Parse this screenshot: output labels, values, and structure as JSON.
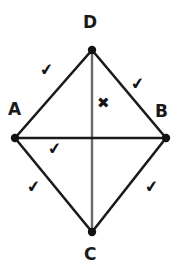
{
  "figure": {
    "background_color": "#ffffff",
    "stroke_color": "#1a1a1a",
    "diagonal_vertical_color": "#6a6a6a",
    "vertices": [
      {
        "id": "D",
        "label": "D",
        "x": 92,
        "y": 50,
        "label_x": 83,
        "label_y": 14
      },
      {
        "id": "A",
        "label": "A",
        "x": 15,
        "y": 138,
        "label_x": 8,
        "label_y": 101
      },
      {
        "id": "B",
        "label": "B",
        "x": 166,
        "y": 138,
        "label_x": 155,
        "label_y": 103
      },
      {
        "id": "C",
        "label": "C",
        "x": 92,
        "y": 232,
        "label_x": 84,
        "label_y": 246
      }
    ],
    "sides": [
      {
        "id": "AD",
        "from": "A",
        "to": "D"
      },
      {
        "id": "DB",
        "from": "D",
        "to": "B"
      },
      {
        "id": "AC",
        "from": "A",
        "to": "C"
      },
      {
        "id": "CB",
        "from": "C",
        "to": "B"
      }
    ],
    "diagonals": [
      {
        "id": "DC",
        "from": "D",
        "to": "C",
        "color": "#6a6a6a"
      },
      {
        "id": "AB",
        "from": "A",
        "to": "B",
        "color": "#1a1a1a"
      }
    ],
    "marks": [
      {
        "id": "check-side-ad",
        "glyph": "✔",
        "kind": "check",
        "x": 40,
        "y": 62,
        "rotate": -8
      },
      {
        "id": "check-side-db",
        "glyph": "✔",
        "kind": "check",
        "x": 131,
        "y": 76,
        "rotate": -8
      },
      {
        "id": "check-angle-a",
        "glyph": "✔",
        "kind": "check",
        "x": 48,
        "y": 141,
        "rotate": -8
      },
      {
        "id": "check-side-ac",
        "glyph": "✔",
        "kind": "check",
        "x": 27,
        "y": 179,
        "rotate": -8
      },
      {
        "id": "check-side-cb",
        "glyph": "✔",
        "kind": "check",
        "x": 145,
        "y": 179,
        "rotate": -8
      },
      {
        "id": "cross-region-d",
        "glyph": "✖",
        "kind": "cross",
        "x": 97,
        "y": 96,
        "rotate": 0
      }
    ]
  }
}
